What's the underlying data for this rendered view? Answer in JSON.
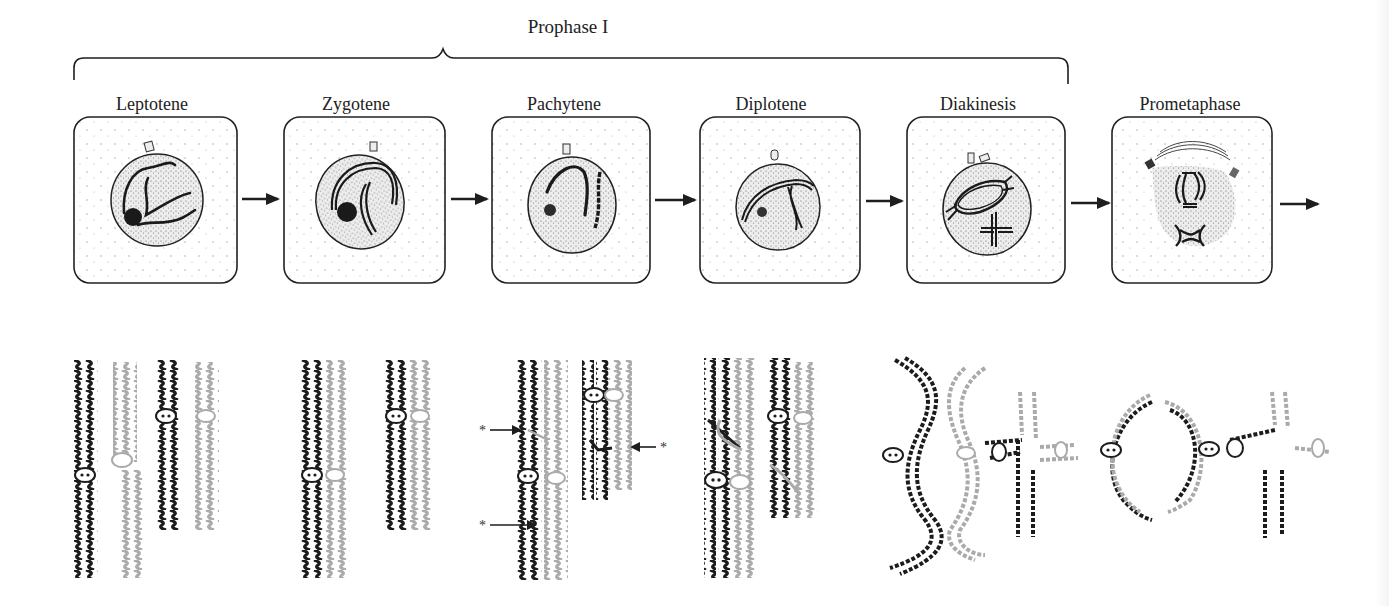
{
  "figure": {
    "title": "Prophase I",
    "bracket_span": [
      "Leptotene",
      "Diakinesis"
    ],
    "stages": [
      {
        "label": "Leptotene",
        "center_x": 152
      },
      {
        "label": "Zygotene",
        "center_x": 356
      },
      {
        "label": "Pachytene",
        "center_x": 564
      },
      {
        "label": "Diplotene",
        "center_x": 771
      },
      {
        "label": "Diakinesis",
        "center_x": 978
      },
      {
        "label": "Prometaphase",
        "center_x": 1190
      }
    ],
    "annotations": {
      "crossover_marker": "*",
      "crossover_marker_count": 3
    },
    "colors": {
      "ink": "#1e1e1e",
      "maternal_chromatid": "#1c1c1c",
      "paternal_chromatid": "#aaaaaa",
      "cell_stipple": "#9a9a9a",
      "background": "#ffffff"
    }
  }
}
